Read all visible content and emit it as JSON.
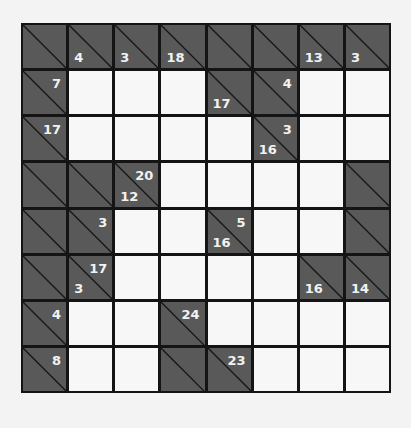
{
  "puzzle": {
    "type": "kakuro",
    "rows": 8,
    "cols": 8,
    "colors": {
      "block": "#595959",
      "white": "#f7f7f7",
      "grid_line": "#141414",
      "clue_text": "#f2f2f2",
      "background": "#f3f3f3"
    },
    "grid": [
      [
        {
          "t": "B",
          "down": "",
          "right": ""
        },
        {
          "t": "B",
          "down": "4",
          "right": ""
        },
        {
          "t": "B",
          "down": "3",
          "right": ""
        },
        {
          "t": "B",
          "down": "18",
          "right": ""
        },
        {
          "t": "B",
          "down": "",
          "right": ""
        },
        {
          "t": "B",
          "down": "",
          "right": ""
        },
        {
          "t": "B",
          "down": "13",
          "right": ""
        },
        {
          "t": "B",
          "down": "3",
          "right": ""
        }
      ],
      [
        {
          "t": "B",
          "down": "",
          "right": "7"
        },
        {
          "t": "W",
          "value": ""
        },
        {
          "t": "W",
          "value": ""
        },
        {
          "t": "W",
          "value": ""
        },
        {
          "t": "B",
          "down": "17",
          "right": ""
        },
        {
          "t": "B",
          "down": "",
          "right": "4"
        },
        {
          "t": "W",
          "value": ""
        },
        {
          "t": "W",
          "value": ""
        }
      ],
      [
        {
          "t": "B",
          "down": "",
          "right": "17"
        },
        {
          "t": "W",
          "value": ""
        },
        {
          "t": "W",
          "value": ""
        },
        {
          "t": "W",
          "value": ""
        },
        {
          "t": "W",
          "value": ""
        },
        {
          "t": "B",
          "down": "16",
          "right": "3"
        },
        {
          "t": "W",
          "value": ""
        },
        {
          "t": "W",
          "value": ""
        }
      ],
      [
        {
          "t": "B",
          "down": "",
          "right": ""
        },
        {
          "t": "B",
          "down": "",
          "right": ""
        },
        {
          "t": "B",
          "down": "12",
          "right": "20"
        },
        {
          "t": "W",
          "value": ""
        },
        {
          "t": "W",
          "value": ""
        },
        {
          "t": "W",
          "value": ""
        },
        {
          "t": "W",
          "value": ""
        },
        {
          "t": "B",
          "down": "",
          "right": ""
        }
      ],
      [
        {
          "t": "B",
          "down": "",
          "right": ""
        },
        {
          "t": "B",
          "down": "",
          "right": "3"
        },
        {
          "t": "W",
          "value": ""
        },
        {
          "t": "W",
          "value": ""
        },
        {
          "t": "B",
          "down": "16",
          "right": "5"
        },
        {
          "t": "W",
          "value": ""
        },
        {
          "t": "W",
          "value": ""
        },
        {
          "t": "B",
          "down": "",
          "right": ""
        }
      ],
      [
        {
          "t": "B",
          "down": "",
          "right": ""
        },
        {
          "t": "B",
          "down": "3",
          "right": "17"
        },
        {
          "t": "W",
          "value": ""
        },
        {
          "t": "W",
          "value": ""
        },
        {
          "t": "W",
          "value": ""
        },
        {
          "t": "W",
          "value": ""
        },
        {
          "t": "B",
          "down": "16",
          "right": ""
        },
        {
          "t": "B",
          "down": "14",
          "right": ""
        }
      ],
      [
        {
          "t": "B",
          "down": "",
          "right": "4"
        },
        {
          "t": "W",
          "value": ""
        },
        {
          "t": "W",
          "value": ""
        },
        {
          "t": "B",
          "down": "",
          "right": "24"
        },
        {
          "t": "W",
          "value": ""
        },
        {
          "t": "W",
          "value": ""
        },
        {
          "t": "W",
          "value": ""
        },
        {
          "t": "W",
          "value": ""
        }
      ],
      [
        {
          "t": "B",
          "down": "",
          "right": "8"
        },
        {
          "t": "W",
          "value": ""
        },
        {
          "t": "W",
          "value": ""
        },
        {
          "t": "B",
          "down": "",
          "right": ""
        },
        {
          "t": "B",
          "down": "",
          "right": "23"
        },
        {
          "t": "W",
          "value": ""
        },
        {
          "t": "W",
          "value": ""
        },
        {
          "t": "W",
          "value": ""
        }
      ]
    ]
  }
}
